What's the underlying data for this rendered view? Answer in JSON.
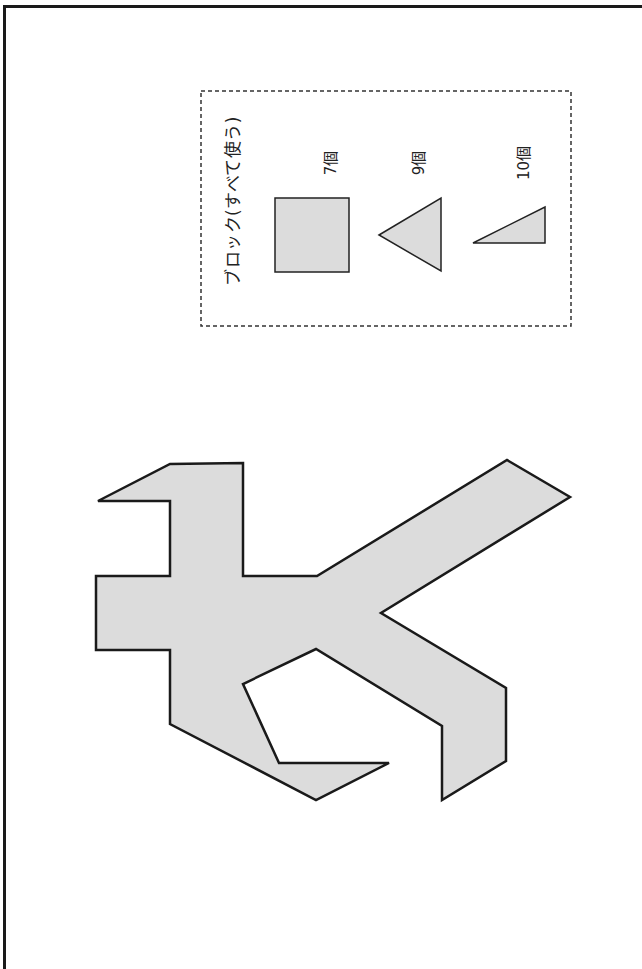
{
  "page": {
    "background": "#ffffff",
    "frame_color": "#1a1a1a"
  },
  "blocks_panel": {
    "title": "ブロック(すべて使う)",
    "items": [
      {
        "shape": "square",
        "count_label": "7個",
        "count": 7
      },
      {
        "shape": "isosceles-triangle",
        "count_label": "9個",
        "count": 9
      },
      {
        "shape": "right-triangle",
        "count_label": "10個",
        "count": 10
      }
    ],
    "fill_color": "#dcdcdc",
    "stroke_color": "#222222"
  },
  "puzzle": {
    "description": "silhouette shape to be filled with blocks",
    "fill_color": "#dcdcdc",
    "stroke_color": "#1a1a1a"
  }
}
